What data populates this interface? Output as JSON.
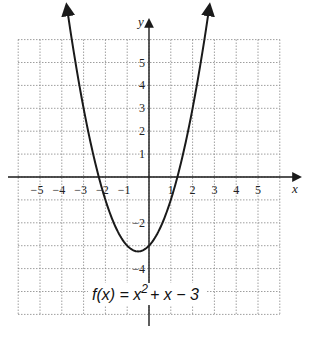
{
  "chart_data": {
    "type": "line",
    "title": "",
    "function_label": "f(x) = x^2 + x - 3",
    "function_label_parts": {
      "prefix": "f(x) = x",
      "exponent": "2",
      "suffix": "+ x − 3"
    },
    "xlabel": "x",
    "ylabel": "y",
    "xlim": [
      -6,
      6
    ],
    "ylim": [
      -6,
      6
    ],
    "x_ticks": [
      -5,
      -4,
      -3,
      -2,
      -1,
      1,
      2,
      3,
      4,
      5
    ],
    "y_ticks": [
      5,
      4,
      3,
      2,
      1,
      -2,
      -4
    ],
    "x_tick_labels": [
      "−5",
      "−4",
      "−3",
      "−2",
      "−1",
      "1",
      "2",
      "3",
      "4",
      "5"
    ],
    "y_tick_labels": [
      "5",
      "4",
      "3",
      "2",
      "1",
      "−2",
      "−4"
    ],
    "grid": true,
    "grid_style": "dotted",
    "series": [
      {
        "name": "f(x) = x^2 + x - 3",
        "x": [
          -3.8,
          -3.5,
          -3,
          -2.5,
          -2,
          -1.5,
          -1,
          -0.5,
          0,
          0.5,
          1,
          1.5,
          2,
          2.5,
          2.8
        ],
        "values": [
          7.64,
          5.75,
          3,
          0.75,
          -1,
          -2.25,
          -3,
          -3.25,
          -3,
          -2.25,
          -1,
          0.75,
          3,
          5.75,
          7.64
        ],
        "vertex": [
          -0.5,
          -3.25
        ],
        "roots": [
          -2.303,
          1.303
        ],
        "y_intercept": -3,
        "arrows_on_ends": true
      }
    ],
    "colors": {
      "curve": "#1a1a1a",
      "axes": "#1a1a1a",
      "grid": "#888888"
    }
  }
}
